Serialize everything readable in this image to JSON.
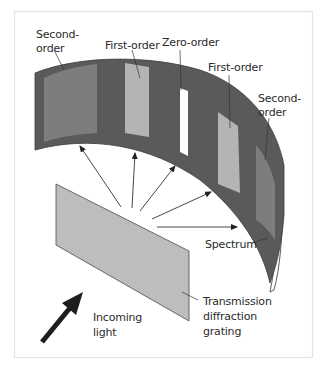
{
  "figure": {
    "labels": {
      "second_order_left": [
        "Second-",
        "order"
      ],
      "first_order_left": "First-order",
      "zero_order": "Zero-order",
      "first_order_right": "First-order",
      "second_order_right": [
        "Second-",
        "order"
      ],
      "spectrum": "Spectrum",
      "grating": [
        "Transmission",
        "diffraction",
        "grating"
      ],
      "incoming_light": [
        "Incoming",
        "light"
      ]
    },
    "colors": {
      "band": "#5a5a5a",
      "second_order_patch": "#7d7d7d",
      "first_order_patch": "#b4b4b4",
      "zero_order_patch": "#ffffff",
      "grating": "#bdbdbd",
      "arrow": "#222222",
      "frame": "#e6e6e6"
    },
    "diffracted_rays": 5
  }
}
